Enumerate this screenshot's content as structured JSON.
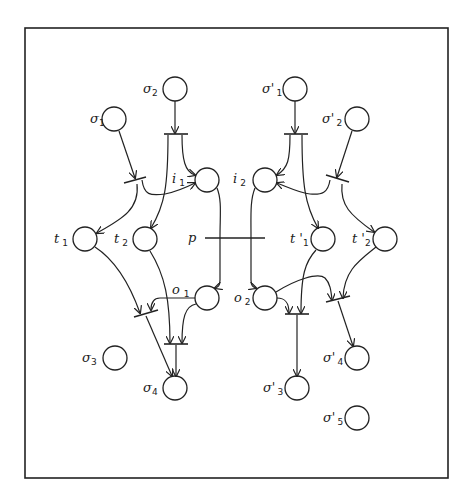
{
  "diagram": {
    "type": "petri-net",
    "frame_color": "#222222",
    "places": [
      {
        "id": "sigma1",
        "base": "σ",
        "sub": "1",
        "cx": 114,
        "cy": 119
      },
      {
        "id": "sigma2",
        "base": "σ",
        "sub": "2",
        "cx": 175,
        "cy": 89
      },
      {
        "id": "sigma3",
        "base": "σ",
        "sub": "3",
        "cx": 115,
        "cy": 358
      },
      {
        "id": "sigma4",
        "base": "σ",
        "sub": "4",
        "cx": 175,
        "cy": 388
      },
      {
        "id": "i1",
        "base": "i",
        "sub": "1",
        "cx": 207,
        "cy": 180
      },
      {
        "id": "i2",
        "base": "i",
        "sub": "2",
        "cx": 265,
        "cy": 180
      },
      {
        "id": "t1",
        "base": "t",
        "sub": "1",
        "cx": 85,
        "cy": 239
      },
      {
        "id": "t2",
        "base": "t",
        "sub": "2",
        "cx": 145,
        "cy": 239
      },
      {
        "id": "o1",
        "base": "o",
        "sub": "1",
        "cx": 207,
        "cy": 298
      },
      {
        "id": "o2",
        "base": "o",
        "sub": "2",
        "cx": 265,
        "cy": 298
      },
      {
        "id": "sigmap1",
        "base": "σ'",
        "sub": "1",
        "cx": 295,
        "cy": 89
      },
      {
        "id": "sigmap2",
        "base": "σ'",
        "sub": "2",
        "cx": 357,
        "cy": 119
      },
      {
        "id": "tp1",
        "base": "t '",
        "sub": "1",
        "cx": 323,
        "cy": 239
      },
      {
        "id": "tp2",
        "base": "t '",
        "sub": "2",
        "cx": 385,
        "cy": 239
      },
      {
        "id": "sigmap3",
        "base": "σ'",
        "sub": "3",
        "cx": 297,
        "cy": 388
      },
      {
        "id": "sigmap4",
        "base": "σ'",
        "sub": "4",
        "cx": 357,
        "cy": 358
      },
      {
        "id": "sigmap5",
        "base": "σ'",
        "sub": "5",
        "cx": 357,
        "cy": 418
      }
    ],
    "transitions": [
      {
        "id": "p",
        "label": "p"
      }
    ],
    "labels": {
      "sigma1": {
        "base": "σ",
        "sub": "1"
      },
      "sigma2": {
        "base": "σ",
        "sub": "2"
      },
      "sigma3": {
        "base": "σ",
        "sub": "3"
      },
      "sigma4": {
        "base": "σ",
        "sub": "4"
      },
      "i1": {
        "base": "i",
        "sub": "1"
      },
      "i2": {
        "base": "i",
        "sub": "2"
      },
      "t1": {
        "base": "t",
        "sub": "1"
      },
      "t2": {
        "base": "t",
        "sub": "2"
      },
      "o1": {
        "base": "o",
        "sub": "1"
      },
      "o2": {
        "base": "o",
        "sub": "2"
      },
      "p": {
        "base": "p"
      },
      "sigmap1": {
        "base": "σ'",
        "sub": "1"
      },
      "sigmap2": {
        "base": "σ'",
        "sub": "2"
      },
      "tp1": {
        "base": "t '",
        "sub": "1"
      },
      "tp2": {
        "base": "t '",
        "sub": "2"
      },
      "sigmap3": {
        "base": "σ'",
        "sub": "3"
      },
      "sigmap4": {
        "base": "σ'",
        "sub": "4"
      },
      "sigmap5": {
        "base": "σ'",
        "sub": "5"
      }
    }
  }
}
